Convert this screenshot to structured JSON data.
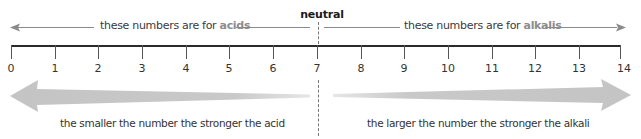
{
  "diagram": {
    "neutral_label": "neutral",
    "neutral_value": 7,
    "acid_range": {
      "prefix": "these numbers are for ",
      "highlight": "acids",
      "direction": "left"
    },
    "alkali_range": {
      "prefix": "these numbers are for ",
      "highlight": "alkalis",
      "direction": "right"
    },
    "scale": {
      "min": 0,
      "max": 14,
      "ticks": [
        "0",
        "1",
        "2",
        "3",
        "4",
        "5",
        "6",
        "7",
        "8",
        "9",
        "10",
        "11",
        "12",
        "13",
        "14"
      ]
    },
    "acid_caption": "the smaller the number the stronger the acid",
    "alkali_caption": "the larger the number the stronger the alkali",
    "colors": {
      "axis": "#2b2b2b",
      "range_line": "#8a8a8a",
      "highlight_text": "#8c8c8c",
      "big_arrow": "#c8c8c8",
      "text": "#3a3a3a"
    },
    "icons": {
      "left_arrow": "arrow-left-icon",
      "right_arrow": "arrow-right-icon",
      "big_left_arrow": "tapered-arrow-left-icon",
      "big_right_arrow": "tapered-arrow-right-icon"
    }
  }
}
